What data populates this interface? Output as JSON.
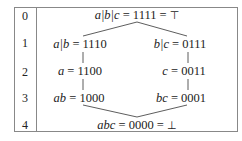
{
  "levels": [
    "0",
    "1",
    "2",
    "3",
    "4"
  ],
  "nodes": {
    "top": {
      "lhs": "a|b|c",
      "eq": " = 1111 = ",
      "sym": "⊤"
    },
    "ab_or": {
      "lhs": "a|b",
      "eq": " = 1110"
    },
    "bc_or": {
      "lhs": "b|c",
      "eq": " = 0111"
    },
    "a": {
      "lhs": "a",
      "eq": " = 1100"
    },
    "c": {
      "lhs": "c",
      "eq": " = 0011"
    },
    "ab": {
      "lhs": "ab",
      "eq": " = 1000"
    },
    "bc": {
      "lhs": "bc",
      "eq": " = 0001"
    },
    "bottom": {
      "lhs": "abc",
      "eq": " = 0000 = ",
      "sym": "⊥"
    }
  }
}
